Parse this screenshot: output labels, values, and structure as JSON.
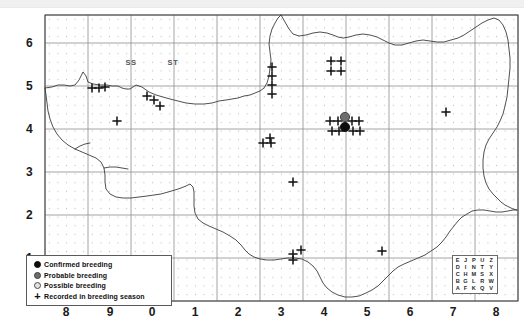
{
  "map": {
    "title": "",
    "grid_square_labels": [
      {
        "name": "SS",
        "cx": 131,
        "cy": 62
      },
      {
        "name": "ST",
        "cx": 173,
        "cy": 62
      }
    ],
    "axes": {
      "x_ticks": [
        "8",
        "9",
        "0",
        "1",
        "2",
        "3",
        "4",
        "5",
        "6",
        "7",
        "8"
      ],
      "x_positions": [
        66,
        110,
        152,
        195,
        238,
        281,
        324,
        367,
        410,
        453,
        496
      ],
      "y_ticks": [
        "6",
        "5",
        "4",
        "3",
        "2",
        "1"
      ],
      "y_positions": [
        43,
        86,
        129,
        172,
        215,
        258
      ]
    },
    "frame": {
      "x": 45,
      "y": 15,
      "width": 473,
      "height": 286
    },
    "cell_size": 43,
    "colors": {
      "confirmed": "#0d0d0d",
      "probable": "#6e6e6e",
      "possible": "#e2e2e2",
      "coastline": "#3c3c3c",
      "gridline": "#8e8e8e",
      "dotgrid": "#c9c9c9",
      "background": "#ffffff"
    }
  },
  "legend": {
    "items": [
      {
        "symbol": "filled-black-circle",
        "label": "Confirmed breeding",
        "kind": "confirmed"
      },
      {
        "symbol": "filled-grey-circle",
        "label": "Probable breeding",
        "kind": "probable"
      },
      {
        "symbol": "open-circle",
        "label": "Possible breeding",
        "kind": "possible"
      },
      {
        "symbol": "plus",
        "label": "Recorded in breeding season",
        "kind": "plus"
      }
    ]
  },
  "tetrad_key": {
    "rows": [
      [
        "E",
        "J",
        "P",
        "U",
        "Z"
      ],
      [
        "D",
        "I",
        "N",
        "T",
        "Y"
      ],
      [
        "C",
        "H",
        "M",
        "S",
        "X"
      ],
      [
        "B",
        "G",
        "L",
        "R",
        "W"
      ],
      [
        "A",
        "F",
        "K",
        "Q",
        "V"
      ]
    ]
  },
  "records": {
    "confirmed": [
      {
        "x": 345,
        "y": 127
      }
    ],
    "probable": [
      {
        "x": 345,
        "y": 117
      }
    ],
    "possible": [],
    "recorded": [
      {
        "x": 92,
        "y": 88
      },
      {
        "x": 99,
        "y": 88
      },
      {
        "x": 105,
        "y": 87
      },
      {
        "x": 147,
        "y": 96
      },
      {
        "x": 154,
        "y": 100
      },
      {
        "x": 160,
        "y": 106
      },
      {
        "x": 117,
        "y": 121
      },
      {
        "x": 272,
        "y": 67
      },
      {
        "x": 272,
        "y": 76
      },
      {
        "x": 272,
        "y": 85
      },
      {
        "x": 272,
        "y": 94
      },
      {
        "x": 331,
        "y": 61
      },
      {
        "x": 341,
        "y": 61
      },
      {
        "x": 331,
        "y": 71
      },
      {
        "x": 341,
        "y": 71
      },
      {
        "x": 330,
        "y": 121
      },
      {
        "x": 338,
        "y": 121
      },
      {
        "x": 352,
        "y": 121
      },
      {
        "x": 359,
        "y": 121
      },
      {
        "x": 332,
        "y": 131
      },
      {
        "x": 339,
        "y": 131
      },
      {
        "x": 353,
        "y": 131
      },
      {
        "x": 360,
        "y": 131
      },
      {
        "x": 446,
        "y": 112
      },
      {
        "x": 270,
        "y": 138
      },
      {
        "x": 263,
        "y": 143
      },
      {
        "x": 271,
        "y": 143
      },
      {
        "x": 293,
        "y": 182
      },
      {
        "x": 293,
        "y": 254
      },
      {
        "x": 301,
        "y": 250
      },
      {
        "x": 293,
        "y": 260
      },
      {
        "x": 382,
        "y": 251
      }
    ]
  }
}
